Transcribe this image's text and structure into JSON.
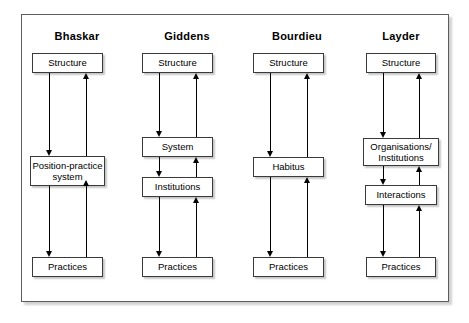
{
  "figure": {
    "type": "four-column-comparison-diagram",
    "columns": [
      {
        "title": "Bhaskar",
        "nodes": [
          {
            "label": "Structure"
          },
          {
            "label": "Position-practice system"
          },
          {
            "label": "Practices"
          }
        ],
        "arrows": [
          {
            "from": "Structure",
            "to": "Position-practice system",
            "direction": "down"
          },
          {
            "from": "Position-practice system",
            "to": "Structure",
            "direction": "up"
          },
          {
            "from": "Position-practice system",
            "to": "Practices",
            "direction": "down"
          },
          {
            "from": "Practices",
            "to": "Position-practice system",
            "direction": "up"
          }
        ]
      },
      {
        "title": "Giddens",
        "nodes": [
          {
            "label": "Structure"
          },
          {
            "label": "System"
          },
          {
            "label": "Institutions"
          },
          {
            "label": "Practices"
          }
        ],
        "arrows": [
          {
            "from": "Structure",
            "to": "System",
            "direction": "down"
          },
          {
            "from": "System",
            "to": "Structure",
            "direction": "up"
          },
          {
            "from": "System",
            "to": "Institutions",
            "direction": "down"
          },
          {
            "from": "Institutions",
            "to": "System",
            "direction": "up"
          },
          {
            "from": "Institutions",
            "to": "Practices",
            "direction": "down"
          },
          {
            "from": "Practices",
            "to": "Institutions",
            "direction": "up"
          }
        ]
      },
      {
        "title": "Bourdieu",
        "nodes": [
          {
            "label": "Structure"
          },
          {
            "label": "Habitus"
          },
          {
            "label": "Practices"
          }
        ],
        "arrows": [
          {
            "from": "Structure",
            "to": "Habitus",
            "direction": "down"
          },
          {
            "from": "Habitus",
            "to": "Structure",
            "direction": "up"
          },
          {
            "from": "Habitus",
            "to": "Practices",
            "direction": "down"
          },
          {
            "from": "Practices",
            "to": "Habitus",
            "direction": "up"
          }
        ]
      },
      {
        "title": "Layder",
        "nodes": [
          {
            "label": "Structure"
          },
          {
            "label": "Organisations/ Institutions"
          },
          {
            "label": "Interactions"
          },
          {
            "label": "Practices"
          }
        ],
        "arrows": [
          {
            "from": "Structure",
            "to": "Organisations/Institutions",
            "direction": "down"
          },
          {
            "from": "Organisations/Institutions",
            "to": "Structure",
            "direction": "up"
          },
          {
            "from": "Organisations/Institutions",
            "to": "Interactions",
            "direction": "down"
          },
          {
            "from": "Interactions",
            "to": "Organisations/Institutions",
            "direction": "up"
          },
          {
            "from": "Interactions",
            "to": "Practices",
            "direction": "down"
          },
          {
            "from": "Practices",
            "to": "Interactions",
            "direction": "up"
          }
        ]
      }
    ]
  },
  "labels": {
    "bhaskar": {
      "title": "Bhaskar",
      "structure": "Structure",
      "position_practice_line1": "Position-practice",
      "position_practice_line2": "system",
      "practices": "Practices"
    },
    "giddens": {
      "title": "Giddens",
      "structure": "Structure",
      "system": "System",
      "institutions": "Institutions",
      "practices": "Practices"
    },
    "bourdieu": {
      "title": "Bourdieu",
      "structure": "Structure",
      "habitus": "Habitus",
      "practices": "Practices"
    },
    "layder": {
      "title": "Layder",
      "structure": "Structure",
      "organisations_line1": "Organisations/",
      "organisations_line2": "Institutions",
      "interactions": "Interactions",
      "practices": "Practices"
    }
  },
  "colors": {
    "frame_border": "#5d5d5d",
    "box_border": "#3a3a3a",
    "arrow": "#000000",
    "background": "#ffffff",
    "text": "#000000"
  }
}
